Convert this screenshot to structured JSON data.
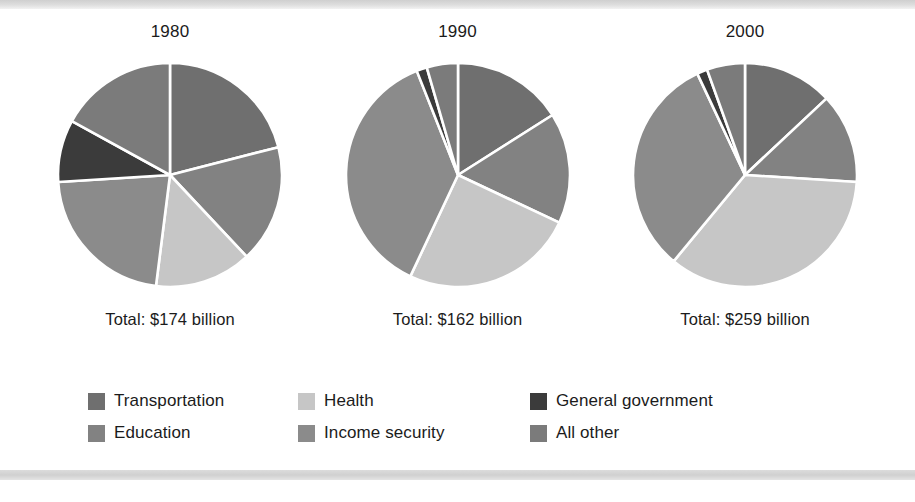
{
  "figure": {
    "background": "#ffffff",
    "rule_color": "#d4d4d4"
  },
  "colors": {
    "transportation": "#6f6f6f",
    "education": "#828282",
    "health": "#c6c6c6",
    "income_security": "#8b8b8b",
    "general_government": "#3b3b3b",
    "all_other": "#7b7b7b",
    "separator": "#ffffff",
    "text": "#1b1b1b"
  },
  "legend": {
    "items": [
      {
        "label": "Transportation",
        "color_key": "transportation",
        "color": "#6f6f6f"
      },
      {
        "label": "Health",
        "color_key": "health",
        "color": "#c6c6c6"
      },
      {
        "label": "General government",
        "color_key": "general_government",
        "color": "#3b3b3b"
      },
      {
        "label": "Education",
        "color_key": "education",
        "color": "#828282"
      },
      {
        "label": "Income security",
        "color_key": "income_security",
        "color": "#8b8b8b"
      },
      {
        "label": "All other",
        "color_key": "all_other",
        "color": "#7b7b7b"
      }
    ]
  },
  "chart_data": {
    "type": "pie",
    "title": "",
    "legend_position": "bottom",
    "grid": false,
    "categories": [
      "Transportation",
      "Education",
      "Health",
      "Income security",
      "General government",
      "All other"
    ],
    "category_colors": [
      "#6f6f6f",
      "#828282",
      "#c6c6c6",
      "#8b8b8b",
      "#3b3b3b",
      "#7b7b7b"
    ],
    "units": "percent of total",
    "charts": [
      {
        "title": "1980",
        "total_label": "Total: $174 billion",
        "total_value": 174,
        "total_units": "billion dollars",
        "slice_order_clockwise_from_12": [
          "Transportation",
          "Education",
          "Health",
          "Income security",
          "General government",
          "All other"
        ],
        "values": [
          21,
          17,
          14,
          22,
          9,
          17
        ]
      },
      {
        "title": "1990",
        "total_label": "Total: $162 billion",
        "total_value": 162,
        "total_units": "billion dollars",
        "slice_order_clockwise_from_12": [
          "Transportation",
          "Education",
          "Health",
          "Income security",
          "General government",
          "All other"
        ],
        "values": [
          16,
          16,
          25,
          37,
          1.5,
          4.5
        ]
      },
      {
        "title": "2000",
        "total_label": "Total: $259 billion",
        "total_value": 259,
        "total_units": "billion dollars",
        "slice_order_clockwise_from_12": [
          "Transportation",
          "Education",
          "Health",
          "Income security",
          "General government",
          "All other"
        ],
        "values": [
          13,
          13,
          35,
          32,
          1.5,
          5.5
        ]
      }
    ]
  }
}
